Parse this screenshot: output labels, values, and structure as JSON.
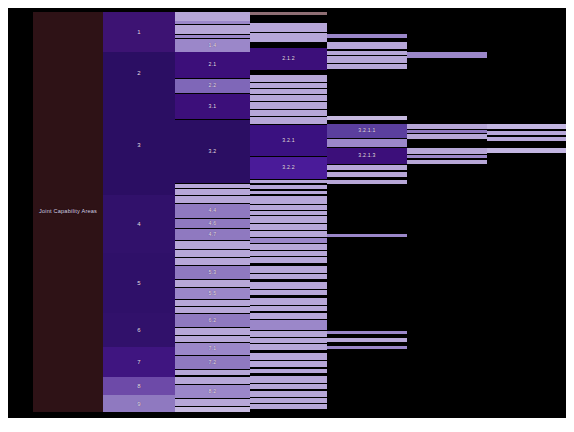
{
  "chart_data": {
    "type": "treemap",
    "title": "Joint Capability Areas",
    "orientation": "horizontal-icicle",
    "background": "#000000",
    "levels": 5,
    "palette": {
      "root": "#2e1216",
      "l1_dark": "#2b0e63",
      "l1_mid": "#3d1373",
      "l1_light": "#6d4aa8",
      "l1_lighter": "#8f79c0",
      "l2_dark": "#3c0f7a",
      "l2_mid": "#5b3f9e",
      "l2_light": "#9b87c9",
      "l2_pale": "#b7a7d8",
      "l3_dark": "#3a1180",
      "l3_light": "#b2a1d4",
      "l3_pale": "#c6b9e0",
      "l4_dark": "#4a1b99",
      "l4_light": "#b9a9da",
      "l5_light": "#c3b6e2",
      "text": "#e8dff2"
    },
    "columns": [
      {
        "name": "root",
        "x": 25,
        "w": 70
      },
      {
        "name": "level1",
        "x": 95,
        "w": 72
      },
      {
        "name": "level2",
        "x": 167,
        "w": 75
      },
      {
        "name": "level3",
        "x": 242,
        "w": 77
      },
      {
        "name": "level4",
        "x": 319,
        "w": 80
      },
      {
        "name": "level5",
        "x": 399,
        "w": 80
      },
      {
        "name": "level6",
        "x": 479,
        "w": 79
      }
    ],
    "root": {
      "label": "Joint Capability Areas",
      "y": 4,
      "h": 400,
      "color": "#2e1216"
    },
    "level1": [
      {
        "label": "1",
        "y": 4,
        "h": 40,
        "color": "#3d1373"
      },
      {
        "label": "2",
        "y": 44,
        "h": 42,
        "color": "#2b0e63"
      },
      {
        "label": "3",
        "y": 86,
        "h": 101,
        "color": "#2b0e63"
      },
      {
        "label": "4",
        "y": 187,
        "h": 58,
        "color": "#31116b"
      },
      {
        "label": "5",
        "y": 245,
        "h": 60,
        "color": "#2f1069"
      },
      {
        "label": "6",
        "y": 305,
        "h": 34,
        "color": "#31116b"
      },
      {
        "label": "7",
        "y": 339,
        "h": 30,
        "color": "#3f1580"
      },
      {
        "label": "8",
        "y": 369,
        "h": 18,
        "color": "#6d4aa8"
      },
      {
        "label": "9",
        "y": 387,
        "h": 17,
        "color": "#8f79c0"
      }
    ],
    "level2": [
      {
        "label": "",
        "y": 4,
        "h": 9,
        "color": "#b7a7d8"
      },
      {
        "label": "",
        "y": 13,
        "h": 3,
        "color": "#9b87c9"
      },
      {
        "label": "",
        "y": 17,
        "h": 9,
        "color": "#b7a7d8"
      },
      {
        "label": "",
        "y": 27,
        "h": 3,
        "color": "#9b87c9"
      },
      {
        "label": "1.4",
        "y": 31,
        "h": 13,
        "color": "#9b87c9"
      },
      {
        "label": "2.1",
        "y": 44,
        "h": 26,
        "color": "#3c0f7a"
      },
      {
        "label": "2.2",
        "y": 71,
        "h": 14,
        "color": "#7f67b8"
      },
      {
        "label": "3.1",
        "y": 86,
        "h": 25,
        "color": "#3c0f7a"
      },
      {
        "label": "3.2",
        "y": 112,
        "h": 63,
        "color": "#2b0e63"
      },
      {
        "label": "",
        "y": 176,
        "h": 4,
        "color": "#b7a7d8"
      },
      {
        "label": "",
        "y": 181,
        "h": 6,
        "color": "#b7a7d8"
      },
      {
        "label": "",
        "y": 188,
        "h": 7,
        "color": "#b7a7d8"
      },
      {
        "label": "4.4",
        "y": 196,
        "h": 14,
        "color": "#8f79c0"
      },
      {
        "label": "4.6",
        "y": 211,
        "h": 9,
        "color": "#8f79c0"
      },
      {
        "label": "4.7",
        "y": 221,
        "h": 11,
        "color": "#8f79c0"
      },
      {
        "label": "",
        "y": 233,
        "h": 8,
        "color": "#b7a7d8"
      },
      {
        "label": "",
        "y": 242,
        "h": 7,
        "color": "#b7a7d8"
      },
      {
        "label": "",
        "y": 250,
        "h": 7,
        "color": "#b7a7d8"
      },
      {
        "label": "5.3",
        "y": 258,
        "h": 13,
        "color": "#8f79c0"
      },
      {
        "label": "",
        "y": 272,
        "h": 7,
        "color": "#b7a7d8"
      },
      {
        "label": "5.5",
        "y": 280,
        "h": 11,
        "color": "#9b87c9"
      },
      {
        "label": "",
        "y": 292,
        "h": 6,
        "color": "#b7a7d8"
      },
      {
        "label": "",
        "y": 299,
        "h": 6,
        "color": "#b7a7d8"
      },
      {
        "label": "6.2",
        "y": 306,
        "h": 13,
        "color": "#8f79c0"
      },
      {
        "label": "",
        "y": 320,
        "h": 7,
        "color": "#b7a7d8"
      },
      {
        "label": "",
        "y": 328,
        "h": 6,
        "color": "#b7a7d8"
      },
      {
        "label": "7.1",
        "y": 335,
        "h": 12,
        "color": "#9b87c9"
      },
      {
        "label": "7.2",
        "y": 348,
        "h": 13,
        "color": "#8f79c0"
      },
      {
        "label": "",
        "y": 362,
        "h": 5,
        "color": "#b7a7d8"
      },
      {
        "label": "",
        "y": 369,
        "h": 7,
        "color": "#b7a7d8"
      },
      {
        "label": "8.2",
        "y": 377,
        "h": 13,
        "color": "#9b87c9"
      },
      {
        "label": "",
        "y": 391,
        "h": 7,
        "color": "#b7a7d8"
      },
      {
        "label": "",
        "y": 399,
        "h": 5,
        "color": "#c6b9e0"
      }
    ],
    "level3": [
      {
        "label": "",
        "y": 4,
        "h": 3,
        "color": "#8f6f74"
      },
      {
        "label": "",
        "y": 8,
        "h": 6,
        "color": "#000000"
      },
      {
        "label": "",
        "y": 15,
        "h": 9,
        "color": "#b7a7d8"
      },
      {
        "label": "",
        "y": 25,
        "h": 9,
        "color": "#b7a7d8"
      },
      {
        "label": "",
        "y": 35,
        "h": 4,
        "color": "#000000"
      },
      {
        "label": "2.1.2",
        "y": 40,
        "h": 22,
        "color": "#3c0f7a"
      },
      {
        "label": "",
        "y": 63,
        "h": 3,
        "color": "#000000"
      },
      {
        "label": "",
        "y": 67,
        "h": 7,
        "color": "#b7a7d8"
      },
      {
        "label": "",
        "y": 75,
        "h": 5,
        "color": "#b7a7d8"
      },
      {
        "label": "",
        "y": 81,
        "h": 5,
        "color": "#b7a7d8"
      },
      {
        "label": "",
        "y": 87,
        "h": 6,
        "color": "#b7a7d8"
      },
      {
        "label": "",
        "y": 94,
        "h": 7,
        "color": "#b7a7d8"
      },
      {
        "label": "",
        "y": 102,
        "h": 6,
        "color": "#b7a7d8"
      },
      {
        "label": "",
        "y": 109,
        "h": 7,
        "color": "#b7a7d8"
      },
      {
        "label": "3.2.1",
        "y": 117,
        "h": 31,
        "color": "#3a1180"
      },
      {
        "label": "3.2.2",
        "y": 149,
        "h": 22,
        "color": "#4a1b99"
      },
      {
        "label": "",
        "y": 172,
        "h": 3,
        "color": "#b7a7d8"
      },
      {
        "label": "",
        "y": 177,
        "h": 4,
        "color": "#b7a7d8"
      },
      {
        "label": "",
        "y": 183,
        "h": 3,
        "color": "#b7a7d8"
      },
      {
        "label": "",
        "y": 188,
        "h": 8,
        "color": "#b7a7d8"
      },
      {
        "label": "",
        "y": 197,
        "h": 5,
        "color": "#b7a7d8"
      },
      {
        "label": "",
        "y": 203,
        "h": 4,
        "color": "#b7a7d8"
      },
      {
        "label": "",
        "y": 208,
        "h": 7,
        "color": "#b7a7d8"
      },
      {
        "label": "",
        "y": 216,
        "h": 6,
        "color": "#b7a7d8"
      },
      {
        "label": "",
        "y": 223,
        "h": 6,
        "color": "#b7a7d8"
      },
      {
        "label": "",
        "y": 230,
        "h": 5,
        "color": "#9b87c9"
      },
      {
        "label": "",
        "y": 236,
        "h": 6,
        "color": "#b7a7d8"
      },
      {
        "label": "",
        "y": 243,
        "h": 5,
        "color": "#b7a7d8"
      },
      {
        "label": "",
        "y": 249,
        "h": 6,
        "color": "#b7a7d8"
      },
      {
        "label": "",
        "y": 258,
        "h": 7,
        "color": "#b7a7d8"
      },
      {
        "label": "",
        "y": 266,
        "h": 5,
        "color": "#b7a7d8"
      },
      {
        "label": "",
        "y": 274,
        "h": 7,
        "color": "#b7a7d8"
      },
      {
        "label": "",
        "y": 282,
        "h": 5,
        "color": "#b7a7d8"
      },
      {
        "label": "",
        "y": 290,
        "h": 7,
        "color": "#b7a7d8"
      },
      {
        "label": "",
        "y": 298,
        "h": 5,
        "color": "#b7a7d8"
      },
      {
        "label": "",
        "y": 305,
        "h": 6,
        "color": "#b7a7d8"
      },
      {
        "label": "",
        "y": 312,
        "h": 10,
        "color": "#9b87c9"
      },
      {
        "label": "",
        "y": 323,
        "h": 6,
        "color": "#b7a7d8"
      },
      {
        "label": "",
        "y": 330,
        "h": 5,
        "color": "#b7a7d8"
      },
      {
        "label": "",
        "y": 336,
        "h": 6,
        "color": "#b7a7d8"
      },
      {
        "label": "",
        "y": 345,
        "h": 7,
        "color": "#b7a7d8"
      },
      {
        "label": "",
        "y": 353,
        "h": 6,
        "color": "#b7a7d8"
      },
      {
        "label": "",
        "y": 361,
        "h": 4,
        "color": "#b7a7d8"
      },
      {
        "label": "",
        "y": 368,
        "h": 7,
        "color": "#b7a7d8"
      },
      {
        "label": "",
        "y": 376,
        "h": 5,
        "color": "#b7a7d8"
      },
      {
        "label": "",
        "y": 383,
        "h": 6,
        "color": "#b7a7d8"
      },
      {
        "label": "",
        "y": 390,
        "h": 5,
        "color": "#b7a7d8"
      },
      {
        "label": "",
        "y": 396,
        "h": 5,
        "color": "#b7a7d8"
      }
    ],
    "level4": [
      {
        "label": "",
        "y": 26,
        "h": 4,
        "color": "#9b87c9"
      },
      {
        "label": "",
        "y": 34,
        "h": 7,
        "color": "#b7a7d8"
      },
      {
        "label": "",
        "y": 43,
        "h": 4,
        "color": "#b7a7d8"
      },
      {
        "label": "",
        "y": 48,
        "h": 7,
        "color": "#b7a7d8"
      },
      {
        "label": "",
        "y": 56,
        "h": 5,
        "color": "#b7a7d8"
      },
      {
        "label": "",
        "y": 108,
        "h": 4,
        "color": "#c6b9e0"
      },
      {
        "label": "3.2.1.1",
        "y": 116,
        "h": 14,
        "color": "#5b3f9e"
      },
      {
        "label": "",
        "y": 131,
        "h": 8,
        "color": "#9b87c9"
      },
      {
        "label": "3.2.1.3",
        "y": 140,
        "h": 16,
        "color": "#3c0f7a"
      },
      {
        "label": "",
        "y": 157,
        "h": 5,
        "color": "#b7a7d8"
      },
      {
        "label": "",
        "y": 164,
        "h": 5,
        "color": "#b7a7d8"
      },
      {
        "label": "",
        "y": 172,
        "h": 4,
        "color": "#b7a7d8"
      },
      {
        "label": "",
        "y": 226,
        "h": 3,
        "color": "#9b87c9"
      },
      {
        "label": "",
        "y": 323,
        "h": 3,
        "color": "#9b87c9"
      },
      {
        "label": "",
        "y": 330,
        "h": 4,
        "color": "#b7a7d8"
      },
      {
        "label": "",
        "y": 338,
        "h": 3,
        "color": "#9b87c9"
      }
    ],
    "level5": [
      {
        "label": "",
        "y": 44,
        "h": 6,
        "color": "#9b87c9"
      },
      {
        "label": "",
        "y": 116,
        "h": 5,
        "color": "#b7a7d8"
      },
      {
        "label": "",
        "y": 122,
        "h": 3,
        "color": "#8f79c0"
      },
      {
        "label": "",
        "y": 126,
        "h": 5,
        "color": "#b7a7d8"
      },
      {
        "label": "",
        "y": 140,
        "h": 6,
        "color": "#b7a7d8"
      },
      {
        "label": "",
        "y": 147,
        "h": 3,
        "color": "#9b87c9"
      },
      {
        "label": "",
        "y": 152,
        "h": 4,
        "color": "#b7a7d8"
      }
    ],
    "level6": [
      {
        "label": "",
        "y": 116,
        "h": 5,
        "color": "#c3b6e2"
      },
      {
        "label": "",
        "y": 123,
        "h": 4,
        "color": "#b7a7d8"
      },
      {
        "label": "",
        "y": 129,
        "h": 4,
        "color": "#b7a7d8"
      },
      {
        "label": "",
        "y": 140,
        "h": 5,
        "color": "#c3b6e2"
      }
    ]
  }
}
